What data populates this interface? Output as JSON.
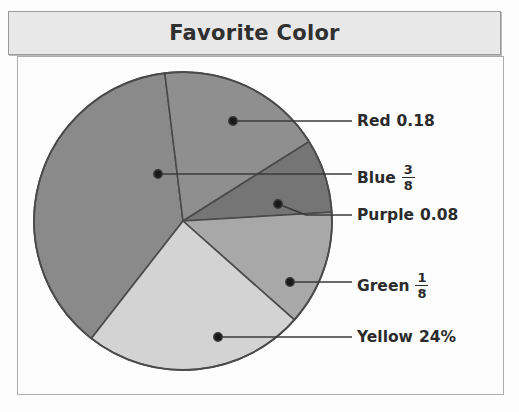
{
  "title": {
    "text": "Favorite Color"
  },
  "chart_data": {
    "type": "pie",
    "title": "Favorite Color",
    "legend_position": "right-callouts",
    "categories": [
      "Red",
      "Blue",
      "Purple",
      "Green",
      "Yellow"
    ],
    "values": [
      0.18,
      0.375,
      0.08,
      0.125,
      0.24
    ],
    "value_labels": [
      "0.18",
      "3/8",
      "0.08",
      "1/8",
      "24%"
    ],
    "value_label_kinds": [
      "decimal",
      "fraction",
      "decimal",
      "fraction",
      "percent"
    ],
    "slice_colors": [
      "#8f8f8f",
      "#8a8a8a",
      "#757575",
      "#a8a8a8",
      "#d3d3d3"
    ],
    "start_angle_deg": -7,
    "xlabel": "",
    "ylabel": ""
  },
  "callouts": [
    {
      "name": "Red",
      "label": "Red",
      "value_text": "0.18",
      "kind": "decimal",
      "numerator": "",
      "denominator": ""
    },
    {
      "name": "Blue",
      "label": "Blue",
      "value_text": "3/8",
      "kind": "fraction",
      "numerator": "3",
      "denominator": "8"
    },
    {
      "name": "Purple",
      "label": "Purple",
      "value_text": "0.08",
      "kind": "decimal",
      "numerator": "",
      "denominator": ""
    },
    {
      "name": "Green",
      "label": "Green",
      "value_text": "1/8",
      "kind": "fraction",
      "numerator": "1",
      "denominator": "8"
    },
    {
      "name": "Yellow",
      "label": "Yellow",
      "value_text": "24%",
      "kind": "percent",
      "numerator": "",
      "denominator": ""
    }
  ]
}
